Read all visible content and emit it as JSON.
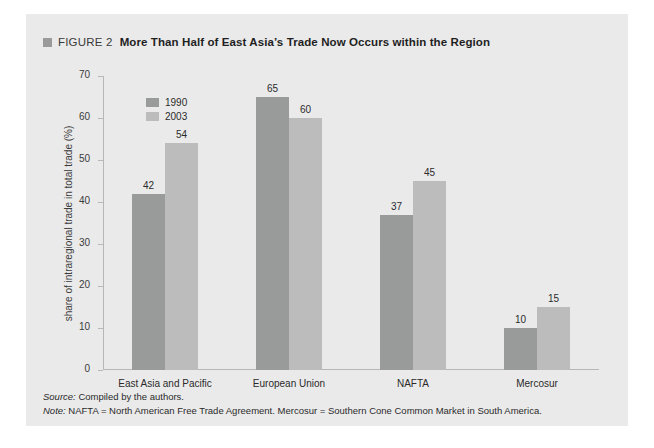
{
  "figure": {
    "marker_icon": "square-marker-icon",
    "label": "FIGURE 2",
    "title": "More Than Half of East Asia’s Trade Now Occurs within the Region"
  },
  "footer": {
    "source_label": "Source:",
    "source_text": " Compiled by the authors.",
    "note_label": "Note:",
    "note_text": " NAFTA = North American Free Trade Agreement. Mercosur = Southern Cone Common Market in South America."
  },
  "colors": {
    "panel_background": "#eaeaea",
    "series_1990": "#999a9a",
    "series_2003": "#bcbcbc",
    "axis": "#b7b7b7",
    "text": "#2b2b2b"
  },
  "chart_data": {
    "type": "bar",
    "title": "More Than Half of East Asia’s Trade Now Occurs within the Region",
    "xlabel": "",
    "ylabel": "share of intraregional trade in total trade (%)",
    "ylim": [
      0,
      70
    ],
    "yticks": [
      0,
      10,
      20,
      30,
      40,
      50,
      60,
      70
    ],
    "grid": false,
    "legend_position": "top-left-inside",
    "categories": [
      "East Asia and Pacific",
      "European Union",
      "NAFTA",
      "Mercosur"
    ],
    "series": [
      {
        "name": "1990",
        "color": "#999a9a",
        "values": [
          42,
          65,
          37,
          10
        ]
      },
      {
        "name": "2003",
        "color": "#bcbcbc",
        "values": [
          54,
          60,
          45,
          15
        ]
      }
    ]
  }
}
